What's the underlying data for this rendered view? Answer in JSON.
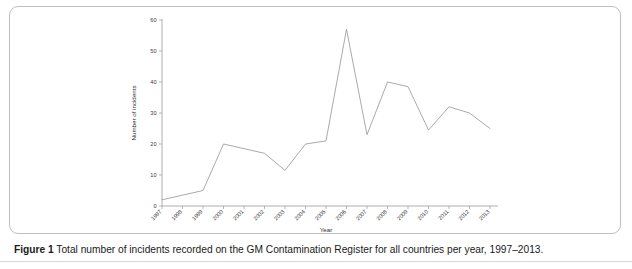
{
  "figure": {
    "caption_label": "Figure 1",
    "caption_text": "Total number of incidents recorded on the GM Contamination Register for all countries per year, 1997–2013."
  },
  "chart_data": {
    "type": "line",
    "title": "",
    "xlabel": "Year",
    "ylabel": "Number of incidents",
    "categories": [
      "1997",
      "1998",
      "1999",
      "2000",
      "2001",
      "2002",
      "2003",
      "2004",
      "2005",
      "2006",
      "2007",
      "2008",
      "2009",
      "2010",
      "2011",
      "2012",
      "2013"
    ],
    "values": [
      2,
      3.5,
      5,
      20,
      18.5,
      17,
      11.5,
      20,
      21,
      57,
      23,
      40,
      38.5,
      24.5,
      32,
      30,
      25
    ],
    "series": [
      {
        "name": "Total incidents",
        "values": [
          2,
          3.5,
          5,
          20,
          18.5,
          17,
          11.5,
          20,
          21,
          57,
          23,
          40,
          38.5,
          24.5,
          32,
          30,
          25
        ]
      }
    ],
    "ylim": [
      0,
      60
    ],
    "yticks": [
      0,
      10,
      20,
      30,
      40,
      50,
      60
    ],
    "ytick_labels": [
      "0",
      "10",
      "20",
      "30",
      "40",
      "50",
      "60"
    ],
    "xtick_labels": [
      "1997",
      "1998",
      "1999",
      "2000",
      "2001",
      "2002",
      "2003",
      "2004",
      "2005",
      "2006",
      "2007",
      "2008",
      "2009",
      "2010",
      "2011",
      "2012",
      "2013"
    ],
    "xtick_rotation": -45,
    "grid": false,
    "legend": false,
    "legend_position": "none",
    "line_color": "#9b9b9b"
  }
}
